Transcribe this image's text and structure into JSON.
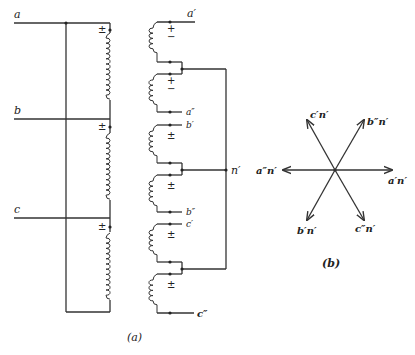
{
  "figure": {
    "part_a_caption": "(a)",
    "part_b_caption": "(b)"
  },
  "primary": {
    "lines": [
      {
        "label": "a"
      },
      {
        "label": "b"
      },
      {
        "label": "c"
      }
    ],
    "polarity_mark": "±"
  },
  "secondary": {
    "terminals": [
      {
        "label": "a′"
      },
      {
        "label": "a″"
      },
      {
        "label": "b′"
      },
      {
        "label": "b″"
      },
      {
        "label": "c′"
      },
      {
        "label": "c″"
      }
    ],
    "neutral_label": "n′",
    "polarity_plus": "+",
    "polarity_minus": "−",
    "polarity_mark": "±"
  },
  "phasor_diagram": {
    "phasors": [
      {
        "label": "a′n′",
        "angle_deg": 0
      },
      {
        "label": "b″n′",
        "angle_deg": 60
      },
      {
        "label": "c′n′",
        "angle_deg": 120
      },
      {
        "label": "a″n′",
        "angle_deg": 180
      },
      {
        "label": "b′n′",
        "angle_deg": 240
      },
      {
        "label": "c″n′",
        "angle_deg": 300
      }
    ]
  },
  "colors": {
    "ink": "#333333",
    "background": "#ffffff"
  }
}
